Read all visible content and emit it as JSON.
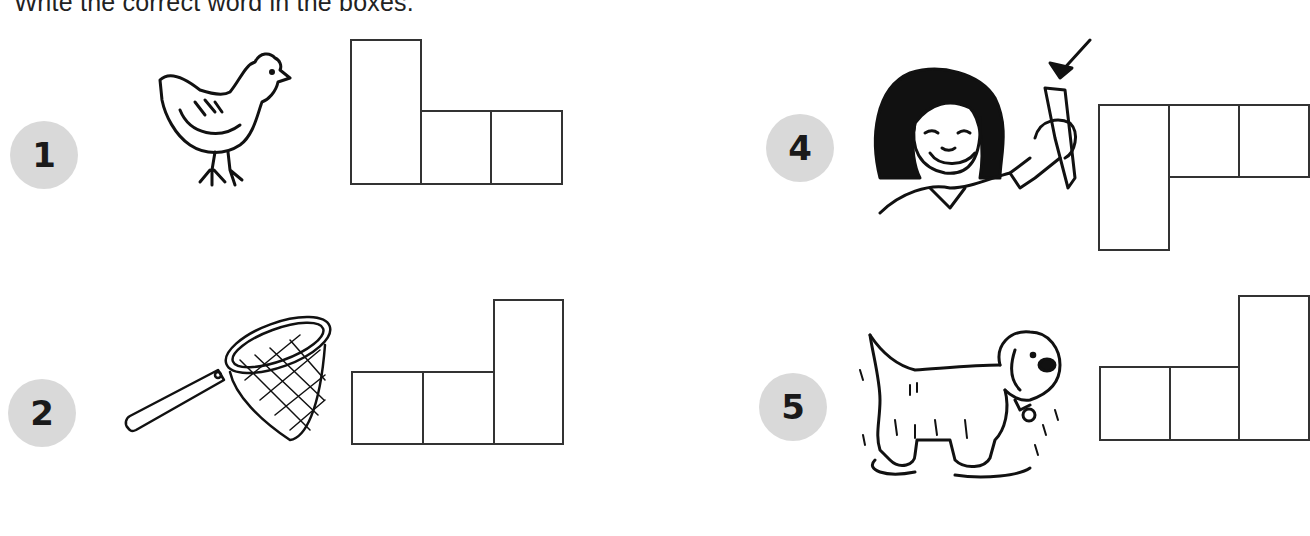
{
  "instruction": "Write the correct word in the boxes.",
  "items": [
    {
      "number": "1",
      "picture": "hen",
      "letters": 3
    },
    {
      "number": "2",
      "picture": "net",
      "letters": 3
    },
    {
      "number": "4",
      "picture": "pen",
      "letters": 3
    },
    {
      "number": "5",
      "picture": "wet dog",
      "letters": 3
    }
  ]
}
